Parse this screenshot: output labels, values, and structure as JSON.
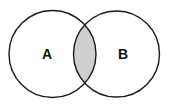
{
  "diagram": {
    "type": "venn",
    "sets": [
      {
        "label": "A",
        "cx": 52.5,
        "cy": 54,
        "r": 43.5
      },
      {
        "label": "B",
        "cx": 116.5,
        "cy": 54,
        "r": 43
      }
    ],
    "highlighted_region": "intersection",
    "colors": {
      "stroke": "#1a1a1a",
      "background": "#ffffff",
      "intersection_fill": "#cfcfcf"
    }
  }
}
